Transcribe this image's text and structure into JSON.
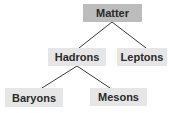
{
  "diagram": {
    "type": "tree",
    "colors": {
      "root": "#bcbcbc",
      "node": "#e6e6e6",
      "edge": "#3a3a3a",
      "text": "#2a2a2a"
    },
    "nodes": {
      "matter": "Matter",
      "hadrons": "Hadrons",
      "leptons": "Leptons",
      "baryons": "Baryons",
      "mesons": "Mesons"
    },
    "edges": [
      [
        "Matter",
        "Hadrons"
      ],
      [
        "Matter",
        "Leptons"
      ],
      [
        "Hadrons",
        "Baryons"
      ],
      [
        "Hadrons",
        "Mesons"
      ]
    ]
  }
}
